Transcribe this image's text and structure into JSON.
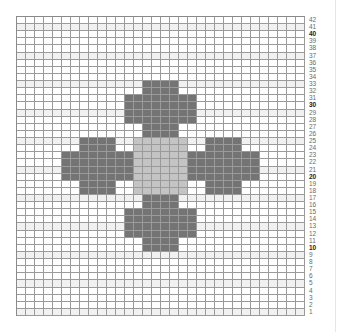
{
  "chart": {
    "title": "",
    "type": "knitting-colorwork-chart",
    "columns": 32,
    "rows": 42,
    "row_label_side": "right",
    "major_row_labels": [
      10,
      20,
      30,
      40
    ],
    "colors": {
      "background": "#ffffff",
      "band": "#f1f1f1",
      "grid": "#9a9a9a",
      "dark": "#747474",
      "light": "#c4c4c4"
    }
  },
  "row_labels": [
    "42",
    "41",
    "40",
    "39",
    "38",
    "37",
    "36",
    "35",
    "34",
    "33",
    "32",
    "31",
    "30",
    "29",
    "28",
    "27",
    "26",
    "25",
    "24",
    "23",
    "22",
    "21",
    "20",
    "19",
    "18",
    "17",
    "16",
    "15",
    "14",
    "13",
    "12",
    "11",
    "10",
    "9",
    "8",
    "7",
    "6",
    "5",
    "4",
    "3",
    "2",
    "1"
  ],
  "chart_data": {
    "type": "heatmap",
    "title": "",
    "xlabel": "",
    "ylabel": "Row",
    "grid": true,
    "columns": 32,
    "rows": 42,
    "row_tick_labels": [
      1,
      2,
      3,
      4,
      5,
      6,
      7,
      8,
      9,
      10,
      11,
      12,
      13,
      14,
      15,
      16,
      17,
      18,
      19,
      20,
      21,
      22,
      23,
      24,
      25,
      26,
      27,
      28,
      29,
      30,
      31,
      32,
      33,
      34,
      35,
      36,
      37,
      38,
      39,
      40,
      41,
      42
    ],
    "legend": [
      {
        "name": "dark",
        "color": "#747474"
      },
      {
        "name": "light",
        "color": "#c4c4c4"
      },
      {
        "name": "background",
        "color": "#ffffff"
      }
    ],
    "regions": [
      {
        "name": "top-arm-narrow",
        "color": "dark",
        "cols": [
          14,
          17
        ],
        "rows": [
          26,
          33
        ]
      },
      {
        "name": "top-arm-wide",
        "color": "dark",
        "cols": [
          12,
          19
        ],
        "rows": [
          28,
          31
        ]
      },
      {
        "name": "bottom-arm-narrow",
        "color": "dark",
        "cols": [
          14,
          17
        ],
        "rows": [
          10,
          17
        ]
      },
      {
        "name": "bottom-arm-wide",
        "color": "dark",
        "cols": [
          12,
          19
        ],
        "rows": [
          12,
          15
        ]
      },
      {
        "name": "left-arm-narrow",
        "color": "dark",
        "cols": [
          7,
          10
        ],
        "rows": [
          18,
          25
        ]
      },
      {
        "name": "left-arm-wide",
        "color": "dark",
        "cols": [
          5,
          12
        ],
        "rows": [
          20,
          23
        ]
      },
      {
        "name": "right-arm-narrow",
        "color": "dark",
        "cols": [
          21,
          24
        ],
        "rows": [
          18,
          25
        ]
      },
      {
        "name": "right-arm-wide",
        "color": "dark",
        "cols": [
          19,
          26
        ],
        "rows": [
          20,
          23
        ]
      },
      {
        "name": "center",
        "color": "light",
        "cols": [
          13,
          18
        ],
        "rows": [
          18,
          25
        ]
      }
    ],
    "shaded_band_rows": [
      41,
      37,
      33,
      29,
      25,
      21,
      17,
      13,
      9,
      5,
      1
    ]
  }
}
